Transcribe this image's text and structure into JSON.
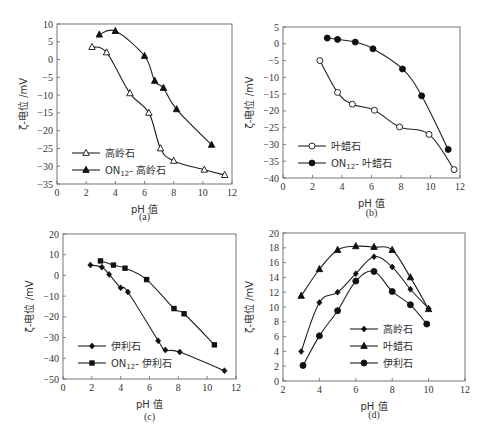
{
  "chart_data": [
    {
      "id": "a",
      "type": "line",
      "caption": "(a)",
      "xlabel": "pH 值",
      "ylabel": "ζ-电位 /mV",
      "xlim": [
        0,
        12
      ],
      "ylim": [
        -35,
        10
      ],
      "xticks": [
        0,
        2,
        4,
        6,
        8,
        10,
        12
      ],
      "yticks": [
        10,
        5,
        0,
        -5,
        -10,
        -15,
        -20,
        -25,
        -30,
        -35
      ],
      "grid": false,
      "legend_position": "lower left",
      "series": [
        {
          "name": "高岭石",
          "marker": "triangle-open",
          "x": [
            2.4,
            3.4,
            5.0,
            6.3,
            7.1,
            8.0,
            10.1,
            11.5
          ],
          "y": [
            3.5,
            2.0,
            -9.5,
            -15.0,
            -25.0,
            -28.5,
            -31.0,
            -32.5
          ]
        },
        {
          "name": "ON12- 高岭石",
          "marker": "triangle-filled",
          "x": [
            2.9,
            4.0,
            6.0,
            6.7,
            7.3,
            8.2,
            10.6
          ],
          "y": [
            7.0,
            8.0,
            1.0,
            -6.0,
            -8.0,
            -14.0,
            -24.0
          ]
        }
      ]
    },
    {
      "id": "b",
      "type": "line",
      "caption": "(b)",
      "xlabel": "pH 值",
      "ylabel": "ζ-电位 /mV",
      "xlim": [
        0,
        12
      ],
      "ylim": [
        -40,
        5
      ],
      "xticks": [
        0,
        2,
        4,
        6,
        8,
        10,
        12
      ],
      "yticks": [
        5,
        0,
        -5,
        -10,
        -15,
        -20,
        -25,
        -30,
        -35,
        -40
      ],
      "grid": false,
      "legend_position": "lower left",
      "series": [
        {
          "name": "叶蜡石",
          "marker": "circle-open",
          "x": [
            2.5,
            3.7,
            4.7,
            6.2,
            7.9,
            9.9,
            11.6
          ],
          "y": [
            -5.0,
            -14.5,
            -18.0,
            -19.8,
            -24.8,
            -27.0,
            -37.5
          ]
        },
        {
          "name": "ON12- 叶蜡石",
          "marker": "circle-filled",
          "x": [
            3.0,
            3.7,
            4.9,
            6.1,
            8.1,
            9.4,
            11.2
          ],
          "y": [
            1.7,
            1.3,
            0.5,
            -1.5,
            -7.5,
            -15.5,
            -31.5
          ]
        }
      ]
    },
    {
      "id": "c",
      "type": "line",
      "caption": "(c)",
      "xlabel": "pH 值",
      "ylabel": "ζ-电位 /mV",
      "xlim": [
        0,
        12
      ],
      "ylim": [
        -50,
        20
      ],
      "xticks": [
        0,
        2,
        4,
        6,
        8,
        10,
        12
      ],
      "yticks": [
        20,
        10,
        0,
        -10,
        -20,
        -30,
        -40,
        -50
      ],
      "grid": false,
      "legend_position": "lower left",
      "series": [
        {
          "name": "伊利石",
          "marker": "diamond-filled",
          "x": [
            1.9,
            2.7,
            3.2,
            4.0,
            4.5,
            6.6,
            7.1,
            8.1,
            11.2
          ],
          "y": [
            5.0,
            4.0,
            0.5,
            -6.0,
            -8.0,
            -31.5,
            -36.0,
            -37.0,
            -46.0
          ]
        },
        {
          "name": "ON12- 伊利石",
          "marker": "square-filled",
          "x": [
            2.6,
            3.5,
            4.3,
            5.8,
            7.7,
            8.4,
            10.5
          ],
          "y": [
            7.0,
            5.0,
            3.5,
            -2.0,
            -16.0,
            -18.5,
            -33.5
          ]
        }
      ]
    },
    {
      "id": "d",
      "type": "line",
      "caption": "(d)",
      "xlabel": "pH 值",
      "ylabel": "ζ-电位 /mV",
      "xlim": [
        2,
        12
      ],
      "ylim": [
        0,
        20
      ],
      "xticks": [
        2,
        4,
        6,
        8,
        10,
        12
      ],
      "yticks": [
        20,
        18,
        16,
        14,
        12,
        10,
        8,
        6,
        4,
        2,
        0
      ],
      "grid": false,
      "legend_position": "lower right",
      "series": [
        {
          "name": "高岭石",
          "marker": "diamond-filled",
          "x": [
            3,
            4,
            5,
            6,
            7,
            8,
            9,
            10
          ],
          "y": [
            4.0,
            10.6,
            12.0,
            14.5,
            16.8,
            15.4,
            12.4,
            9.8
          ]
        },
        {
          "name": "叶蜡石",
          "marker": "triangle-filled",
          "x": [
            3,
            4,
            5,
            6,
            7,
            8,
            9,
            10
          ],
          "y": [
            11.5,
            15.1,
            17.7,
            18.2,
            18.1,
            17.7,
            14.0,
            9.7
          ]
        },
        {
          "name": "伊利石",
          "marker": "circle-filled",
          "x": [
            3.1,
            4,
            5,
            6,
            7,
            8,
            9,
            9.9
          ],
          "y": [
            2.1,
            6.1,
            9.5,
            13.5,
            14.8,
            12.1,
            10.3,
            7.7
          ]
        }
      ]
    }
  ]
}
